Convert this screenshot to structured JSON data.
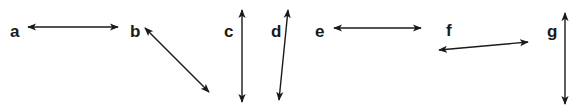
{
  "diagram": {
    "arrows": [
      {
        "label": "a",
        "orientation": "horizontal",
        "lx": 10,
        "ly": 37,
        "x1": 28,
        "y1": 27,
        "x2": 118,
        "y2": 27
      },
      {
        "label": "b",
        "orientation": "diagonal (down-right)",
        "lx": 130,
        "ly": 37,
        "x1": 145,
        "y1": 28,
        "x2": 209,
        "y2": 92
      },
      {
        "label": "c",
        "orientation": "vertical",
        "lx": 224,
        "ly": 37,
        "x1": 242,
        "y1": 10,
        "x2": 242,
        "y2": 102
      },
      {
        "label": "d",
        "orientation": "near-vertical (tilted)",
        "lx": 271,
        "ly": 37,
        "x1": 288,
        "y1": 10,
        "x2": 279,
        "y2": 100
      },
      {
        "label": "e",
        "orientation": "horizontal",
        "lx": 315,
        "ly": 37,
        "x1": 334,
        "y1": 28,
        "x2": 421,
        "y2": 28
      },
      {
        "label": "f",
        "orientation": "near-horizontal (tilted)",
        "lx": 446,
        "ly": 36,
        "x1": 439,
        "y1": 50,
        "x2": 528,
        "y2": 42
      },
      {
        "label": "g",
        "orientation": "vertical",
        "lx": 547,
        "ly": 37,
        "x1": 565,
        "y1": 13,
        "x2": 565,
        "y2": 104
      }
    ]
  },
  "colors": {
    "stroke": "#1a1a1a",
    "background": "#ffffff"
  }
}
